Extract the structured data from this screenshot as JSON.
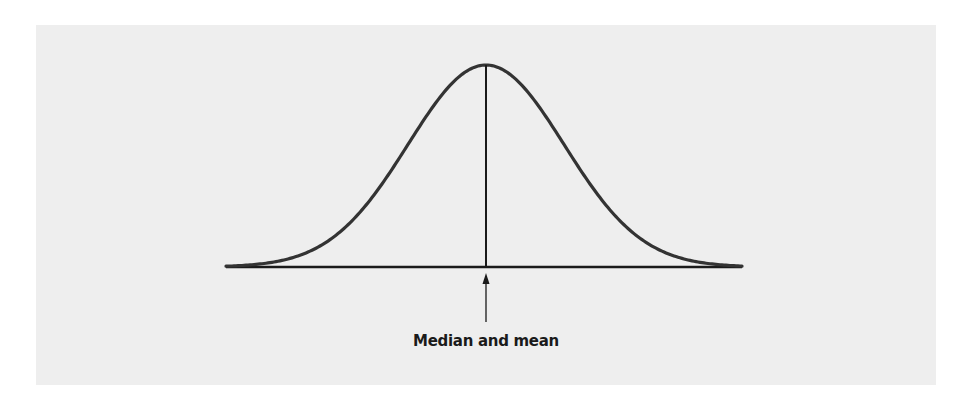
{
  "diagram": {
    "annotation": "Median and mean",
    "colors": {
      "page_background": "#ffffff",
      "panel_background": "#eeeeee",
      "curve": "#333333",
      "lines": "#1a1a1a"
    },
    "geometry": {
      "center_x": 486,
      "peak_y": 65,
      "baseline_y": 267,
      "baseline_x_start": 226,
      "baseline_x_end": 742,
      "sigma_px": 78
    }
  },
  "chart_data": {
    "type": "line",
    "title": "",
    "xlabel": "",
    "ylabel": "",
    "annotations": [
      {
        "text": "Median and mean",
        "points_to": "center of distribution (x = mean)"
      }
    ],
    "series": [
      {
        "name": "density",
        "shape": "normal",
        "mean": 0,
        "sd": 1,
        "x_range": [
          -3.3,
          3.3
        ]
      }
    ]
  }
}
